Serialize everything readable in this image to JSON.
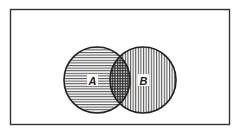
{
  "diagram": {
    "type": "venn",
    "sets": [
      {
        "name": "A",
        "label": "A",
        "hatch": "horizontal"
      },
      {
        "name": "B",
        "label": "B",
        "hatch": "vertical"
      }
    ],
    "intersection": {
      "hatch": "cross"
    },
    "colors": {
      "stroke": "#222222",
      "background": "#ffffff"
    }
  }
}
